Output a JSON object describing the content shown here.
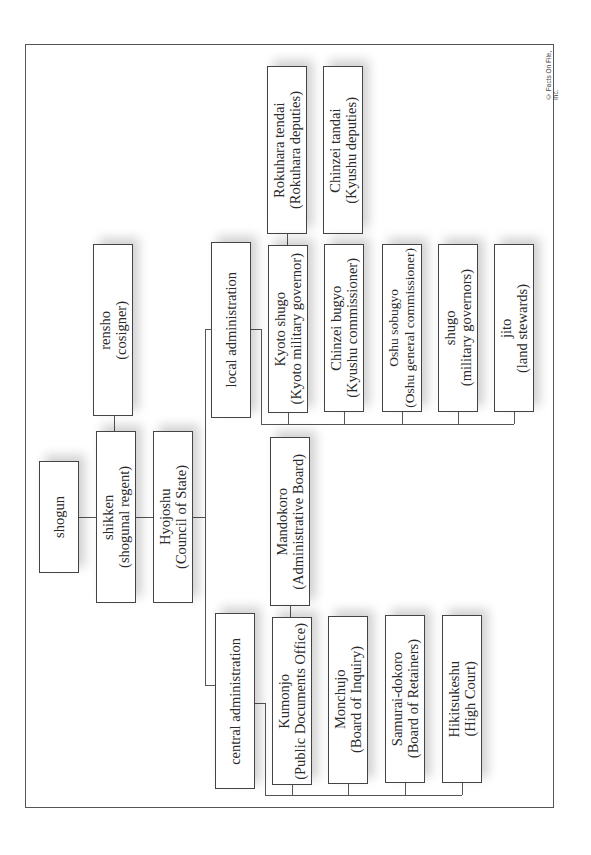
{
  "diagram": {
    "credit": "© Facts On File, Inc.",
    "nodes": {
      "shogun": {
        "line1": "shogun",
        "line2": ""
      },
      "shikken": {
        "line1": "shikken",
        "line2": "(shogunal regent)"
      },
      "rensho": {
        "line1": "rensho",
        "line2": "(cosigner)"
      },
      "hyojoshu": {
        "line1": "Hyojoshu",
        "line2": "(Council of State)"
      },
      "local_admin": {
        "line1": "local administration",
        "line2": ""
      },
      "central_admin": {
        "line1": "central administration",
        "line2": ""
      },
      "kyoto_shugo": {
        "line1": "Kyoto shugo",
        "line2": "(Kyoto military governor)"
      },
      "rokuhara_tandai": {
        "line1": "Rokuhara tendai",
        "line2": "(Rokuhara deputies)"
      },
      "chinzei_bugyo": {
        "line1": "Chinzei bugyo",
        "line2": "(Kyushu commissioner)"
      },
      "chinzei_tandai": {
        "line1": "Chinzei tandai",
        "line2": "(Kyushu deputies)"
      },
      "oshu_sobugyo": {
        "line1": "Oshu sobugyo",
        "line2": "(Oshu general commissioner)"
      },
      "shugo": {
        "line1": "shugo",
        "line2": "(military governors)"
      },
      "jito": {
        "line1": "jito",
        "line2": "(land stewards)"
      },
      "mandokoro": {
        "line1": "Mandokoro",
        "line2": "(Administrative Board)"
      },
      "kumonjo": {
        "line1": "Kumonjo",
        "line2": "(Public Documents Office)"
      },
      "monchujo": {
        "line1": "Monchujo",
        "line2": "(Board of Inquiry)"
      },
      "samurai_dokoro": {
        "line1": "Samurai-dokoro",
        "line2": "(Board of Retainers)"
      },
      "hikitsukeshu": {
        "line1": "Hikitsukeshu",
        "line2": "(High Court)"
      }
    },
    "edges": [
      [
        "shogun",
        "shikken"
      ],
      [
        "shikken",
        "rensho"
      ],
      [
        "shikken",
        "hyojoshu"
      ],
      [
        "hyojoshu",
        "local_admin"
      ],
      [
        "hyojoshu",
        "central_admin"
      ],
      [
        "local_admin",
        "kyoto_shugo"
      ],
      [
        "local_admin",
        "chinzei_bugyo"
      ],
      [
        "local_admin",
        "oshu_sobugyo"
      ],
      [
        "local_admin",
        "shugo"
      ],
      [
        "local_admin",
        "jito"
      ],
      [
        "kyoto_shugo",
        "rokuhara_tandai"
      ],
      [
        "chinzei_bugyo",
        "chinzei_tandai"
      ],
      [
        "central_admin",
        "kumonjo"
      ],
      [
        "central_admin",
        "monchujo"
      ],
      [
        "central_admin",
        "samurai_dokoro"
      ],
      [
        "central_admin",
        "hikitsukeshu"
      ],
      [
        "kumonjo",
        "mandokoro"
      ]
    ]
  }
}
